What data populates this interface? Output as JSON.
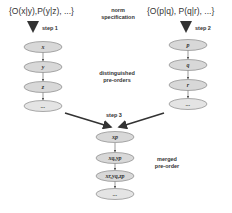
{
  "left_formula": "{O(x|y),P(y|z), ...}",
  "right_formula": "{O(p|q), P(q|r), ...}",
  "labels": {
    "norm_specification": [
      "norm",
      "specification"
    ],
    "distinguished_preorders": [
      "distinguished",
      "pre-orders"
    ],
    "merged_preorder": [
      "merged",
      "pre-order"
    ]
  },
  "steps": {
    "step1": "step 1",
    "step2": "step 2",
    "step3": "step 3"
  },
  "left_chain": [
    "x",
    "y",
    "z",
    "..."
  ],
  "right_chain": [
    "p",
    "q",
    "r",
    "..."
  ],
  "merged_chain": [
    "xp",
    "xq,yp",
    "xr,yq,zp",
    "..."
  ],
  "colors": {
    "ellipse_fill": "#d8d8d8",
    "ellipse_stroke": "#888888",
    "arrow": "#333333"
  }
}
